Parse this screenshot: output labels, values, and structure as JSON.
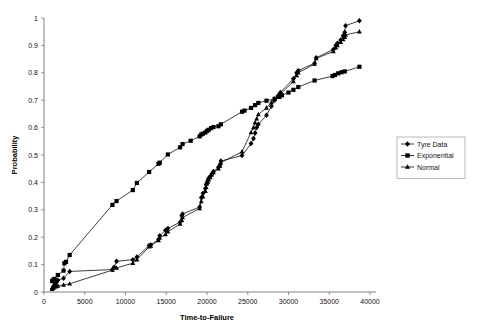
{
  "chart_data": {
    "type": "line",
    "title": "",
    "xlabel": "Time-to-Failure",
    "ylabel": "Probability",
    "xlim": [
      0,
      40000
    ],
    "ylim": [
      0,
      1
    ],
    "xticks": [
      0,
      5000,
      10000,
      15000,
      20000,
      25000,
      30000,
      35000,
      40000
    ],
    "xtick_labels": [
      "0",
      "5000",
      "10000",
      "15000",
      "20000",
      "25000",
      "30000",
      "35000",
      "40000"
    ],
    "yticks": [
      0,
      0.1,
      0.2,
      0.3,
      0.4,
      0.5,
      0.6,
      0.7,
      0.8,
      0.9,
      1
    ],
    "ytick_labels": [
      "0",
      "0.1",
      "0.2",
      "0.3",
      "0.4",
      "0.5",
      "0.6",
      "0.7",
      "0.8",
      "0.9",
      "1"
    ],
    "grid": false,
    "legend_position": "right",
    "series": [
      {
        "name": "Tyre Data",
        "marker": "diamond",
        "color": "#000000",
        "points": [
          [
            1000,
            0.012
          ],
          [
            1150,
            0.02
          ],
          [
            1300,
            0.028
          ],
          [
            1500,
            0.035
          ],
          [
            1700,
            0.043
          ],
          [
            2400,
            0.05
          ],
          [
            3150,
            0.075
          ],
          [
            8400,
            0.082
          ],
          [
            8600,
            0.09
          ],
          [
            8900,
            0.112
          ],
          [
            10900,
            0.118
          ],
          [
            11400,
            0.128
          ],
          [
            12900,
            0.17
          ],
          [
            13100,
            0.172
          ],
          [
            14050,
            0.192
          ],
          [
            14200,
            0.205
          ],
          [
            14900,
            0.225
          ],
          [
            15200,
            0.232
          ],
          [
            16700,
            0.255
          ],
          [
            16900,
            0.278
          ],
          [
            17000,
            0.285
          ],
          [
            19100,
            0.31
          ],
          [
            19300,
            0.345
          ],
          [
            19500,
            0.36
          ],
          [
            19800,
            0.378
          ],
          [
            19900,
            0.392
          ],
          [
            20000,
            0.4
          ],
          [
            20100,
            0.408
          ],
          [
            20200,
            0.415
          ],
          [
            20400,
            0.422
          ],
          [
            20600,
            0.432
          ],
          [
            20800,
            0.44
          ],
          [
            21400,
            0.455
          ],
          [
            21600,
            0.465
          ],
          [
            21700,
            0.478
          ],
          [
            24300,
            0.498
          ],
          [
            25400,
            0.542
          ],
          [
            25700,
            0.56
          ],
          [
            25900,
            0.58
          ],
          [
            26100,
            0.6
          ],
          [
            26300,
            0.612
          ],
          [
            27300,
            0.645
          ],
          [
            27900,
            0.678
          ],
          [
            28300,
            0.7
          ],
          [
            28700,
            0.715
          ],
          [
            28900,
            0.722
          ],
          [
            29000,
            0.728
          ],
          [
            30600,
            0.778
          ],
          [
            31000,
            0.8
          ],
          [
            31200,
            0.808
          ],
          [
            33200,
            0.835
          ],
          [
            33400,
            0.855
          ],
          [
            35500,
            0.885
          ],
          [
            35800,
            0.9
          ],
          [
            36000,
            0.908
          ],
          [
            36400,
            0.92
          ],
          [
            36700,
            0.935
          ],
          [
            36900,
            0.948
          ],
          [
            37000,
            0.972
          ],
          [
            38700,
            0.99
          ]
        ]
      },
      {
        "name": "Exponential",
        "marker": "square",
        "color": "#000000",
        "points": [
          [
            1000,
            0.04
          ],
          [
            1150,
            0.045
          ],
          [
            1300,
            0.048
          ],
          [
            1700,
            0.062
          ],
          [
            2400,
            0.078
          ],
          [
            2500,
            0.105
          ],
          [
            2700,
            0.11
          ],
          [
            3150,
            0.135
          ],
          [
            8400,
            0.318
          ],
          [
            8900,
            0.332
          ],
          [
            10900,
            0.372
          ],
          [
            11400,
            0.398
          ],
          [
            12900,
            0.438
          ],
          [
            14050,
            0.468
          ],
          [
            14200,
            0.472
          ],
          [
            15200,
            0.502
          ],
          [
            16700,
            0.528
          ],
          [
            17000,
            0.54
          ],
          [
            18000,
            0.552
          ],
          [
            19100,
            0.568
          ],
          [
            19300,
            0.575
          ],
          [
            19500,
            0.578
          ],
          [
            19800,
            0.582
          ],
          [
            20000,
            0.588
          ],
          [
            20200,
            0.592
          ],
          [
            20500,
            0.598
          ],
          [
            20800,
            0.602
          ],
          [
            21400,
            0.605
          ],
          [
            21700,
            0.612
          ],
          [
            24300,
            0.658
          ],
          [
            24600,
            0.662
          ],
          [
            25400,
            0.672
          ],
          [
            25900,
            0.682
          ],
          [
            26300,
            0.69
          ],
          [
            27300,
            0.698
          ],
          [
            28300,
            0.705
          ],
          [
            28900,
            0.712
          ],
          [
            29200,
            0.718
          ],
          [
            30000,
            0.728
          ],
          [
            30600,
            0.738
          ],
          [
            31200,
            0.748
          ],
          [
            33200,
            0.772
          ],
          [
            35400,
            0.788
          ],
          [
            35700,
            0.792
          ],
          [
            36100,
            0.798
          ],
          [
            36500,
            0.802
          ],
          [
            36900,
            0.805
          ],
          [
            38700,
            0.822
          ]
        ]
      },
      {
        "name": "Normal",
        "marker": "triangle",
        "color": "#000000",
        "points": [
          [
            1000,
            0.01
          ],
          [
            1150,
            0.014
          ],
          [
            1300,
            0.018
          ],
          [
            1500,
            0.02
          ],
          [
            1700,
            0.022
          ],
          [
            2400,
            0.026
          ],
          [
            3150,
            0.03
          ],
          [
            8400,
            0.08
          ],
          [
            8900,
            0.088
          ],
          [
            10900,
            0.105
          ],
          [
            11400,
            0.118
          ],
          [
            12900,
            0.165
          ],
          [
            13100,
            0.168
          ],
          [
            14050,
            0.188
          ],
          [
            14200,
            0.198
          ],
          [
            14900,
            0.21
          ],
          [
            15200,
            0.22
          ],
          [
            16700,
            0.248
          ],
          [
            16900,
            0.262
          ],
          [
            17000,
            0.272
          ],
          [
            19100,
            0.305
          ],
          [
            19300,
            0.33
          ],
          [
            19500,
            0.348
          ],
          [
            19800,
            0.368
          ],
          [
            19900,
            0.382
          ],
          [
            20000,
            0.395
          ],
          [
            20100,
            0.402
          ],
          [
            20200,
            0.41
          ],
          [
            20400,
            0.418
          ],
          [
            20600,
            0.428
          ],
          [
            20800,
            0.436
          ],
          [
            21400,
            0.45
          ],
          [
            21600,
            0.46
          ],
          [
            21700,
            0.472
          ],
          [
            24300,
            0.512
          ],
          [
            25400,
            0.582
          ],
          [
            25700,
            0.6
          ],
          [
            25900,
            0.618
          ],
          [
            26100,
            0.632
          ],
          [
            26300,
            0.648
          ],
          [
            27300,
            0.672
          ],
          [
            27900,
            0.692
          ],
          [
            28300,
            0.705
          ],
          [
            28700,
            0.712
          ],
          [
            28900,
            0.718
          ],
          [
            29000,
            0.722
          ],
          [
            30600,
            0.768
          ],
          [
            31000,
            0.79
          ],
          [
            31200,
            0.8
          ],
          [
            33200,
            0.832
          ],
          [
            33400,
            0.852
          ],
          [
            35500,
            0.878
          ],
          [
            35800,
            0.892
          ],
          [
            36000,
            0.9
          ],
          [
            36400,
            0.912
          ],
          [
            36700,
            0.922
          ],
          [
            36900,
            0.93
          ],
          [
            37000,
            0.938
          ],
          [
            38700,
            0.95
          ]
        ]
      }
    ]
  },
  "legend": {
    "items": [
      {
        "label": "Tyre Data",
        "marker": "diamond"
      },
      {
        "label": "Exponential",
        "marker": "square"
      },
      {
        "label": "Normal",
        "marker": "triangle"
      }
    ]
  }
}
